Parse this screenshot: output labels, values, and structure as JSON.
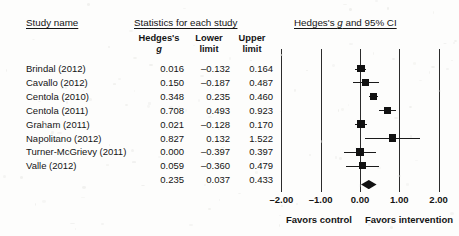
{
  "figure": {
    "headers": {
      "study_name": "Study name",
      "statistics": "Statistics for each study",
      "plot_title_pre": "Hedges's ",
      "plot_title_italic": "g",
      "plot_title_post": " and 95% CI"
    },
    "columns": {
      "effect_pre": "Hedges's",
      "effect_italic": "g",
      "lower_line1": "Lower",
      "lower_line2": "limit",
      "upper_line1": "Upper",
      "upper_line2": "limit"
    },
    "axis": {
      "ticks": [
        "-2.00",
        "-1.00",
        "0.00",
        "1.00",
        "2.00"
      ],
      "tick_values": [
        -2,
        -1,
        0,
        1,
        2
      ],
      "favors_left": "Favors control",
      "favors_right": "Favors intervention"
    },
    "colors": {
      "marker": "#111111",
      "line": "#1a1a1a",
      "grid": "#2b2b2b",
      "text": "#141414",
      "background": "#fdfdfc"
    }
  },
  "chart_data": {
    "type": "forest",
    "title": "Hedges's g and 95% CI",
    "xlabel": "Hedges's g",
    "ylabel": "",
    "xlim": [
      -2.0,
      2.0
    ],
    "xticks": [
      -2.0,
      -1.0,
      0.0,
      1.0,
      2.0
    ],
    "grid": true,
    "legend": "none",
    "effect_measure": "Hedges's g",
    "null_line": 0.0,
    "columns": [
      "Study name",
      "Hedges's g",
      "Lower limit",
      "Upper limit"
    ],
    "rows": [
      {
        "study": "Brindal (2012)",
        "g": "0.016",
        "lower": "–0.132",
        "upper": "0.164",
        "g_num": 0.016,
        "lower_num": -0.132,
        "upper_num": 0.164,
        "weight": 1.0,
        "summary": false
      },
      {
        "study": "Cavallo (2012)",
        "g": "0.150",
        "lower": "–0.187",
        "upper": "0.487",
        "g_num": 0.15,
        "lower_num": -0.187,
        "upper_num": 0.487,
        "weight": 0.74,
        "summary": false
      },
      {
        "study": "Centola (2010)",
        "g": "0.348",
        "lower": "0.235",
        "upper": "0.460",
        "g_num": 0.348,
        "lower_num": 0.235,
        "upper_num": 0.46,
        "weight": 0.72,
        "summary": false
      },
      {
        "study": "Centola (2011)",
        "g": "0.708",
        "lower": "0.493",
        "upper": "0.923",
        "g_num": 0.708,
        "lower_num": 0.493,
        "upper_num": 0.923,
        "weight": 0.72,
        "summary": false
      },
      {
        "study": "Graham (2011)",
        "g": "0.021",
        "lower": "–0.128",
        "upper": "0.170",
        "g_num": 0.021,
        "lower_num": -0.128,
        "upper_num": 0.17,
        "weight": 0.86,
        "summary": false
      },
      {
        "study": "Napolitano (2012)",
        "g": "0.827",
        "lower": "0.132",
        "upper": "1.522",
        "g_num": 0.827,
        "lower_num": 0.132,
        "upper_num": 1.522,
        "weight": 0.72,
        "summary": false
      },
      {
        "study": "Turner-McGrievy (2011)",
        "g": "0.000",
        "lower": "–0.397",
        "upper": "0.397",
        "g_num": 0.0,
        "lower_num": -0.397,
        "upper_num": 0.397,
        "weight": 0.86,
        "summary": false
      },
      {
        "study": "Valle (2012)",
        "g": "0.059",
        "lower": "–0.360",
        "upper": "0.479",
        "g_num": 0.059,
        "lower_num": -0.36,
        "upper_num": 0.479,
        "weight": 0.8,
        "summary": false
      },
      {
        "study": "",
        "g": "0.235",
        "lower": "0.037",
        "upper": "0.433",
        "g_num": 0.235,
        "lower_num": 0.037,
        "upper_num": 0.433,
        "weight": 1.0,
        "summary": true
      }
    ]
  }
}
